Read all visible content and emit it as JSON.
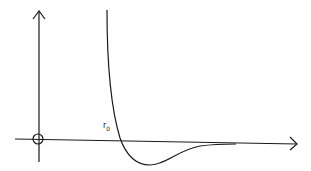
{
  "diagram": {
    "type": "potential-energy-curve",
    "labels": {
      "r0": {
        "base": "r",
        "sub": "0"
      }
    },
    "colors": {
      "background": "#ffffff",
      "stroke": "#1a1a1a"
    },
    "axes": {
      "x_axis": {
        "direction": "right",
        "arrow": true
      },
      "y_axis": {
        "direction": "up",
        "arrow": true
      },
      "origin_marker": "circle"
    }
  }
}
